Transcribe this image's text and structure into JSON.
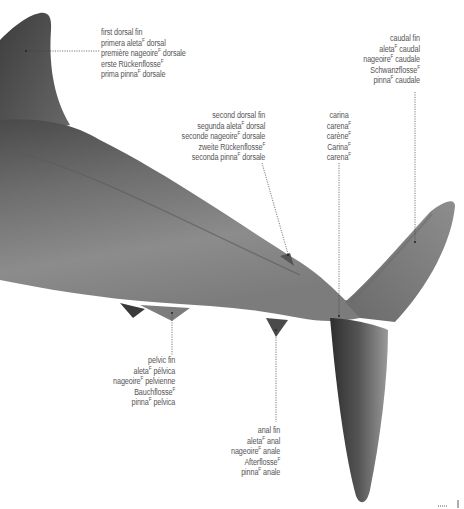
{
  "figure": {
    "colors": {
      "body_dark": "#3f3f3f",
      "body_mid": "#7a7a7a",
      "body_light": "#9a9a9a",
      "leader_line": "#444444",
      "text": "#555555"
    }
  },
  "labels": {
    "first_dorsal_fin": {
      "en": "first dorsal fin",
      "es": "primera aleta",
      "es_tail": " dorsal",
      "fr": "première nageoire",
      "fr_tail": " dorsale",
      "de": "erste Rückenflosse",
      "de_tail": "",
      "it": "prima pinna",
      "it_tail": " dorsale",
      "gender": "F"
    },
    "caudal_fin": {
      "en": "caudal fin",
      "es": "aleta",
      "es_tail": " caudal",
      "fr": "nageoire",
      "fr_tail": " caudale",
      "de": "Schwanzflosse",
      "de_tail": "",
      "it": "pinna",
      "it_tail": " caudale",
      "gender": "F"
    },
    "second_dorsal_fin": {
      "en": "second dorsal fin",
      "es": "segunda aleta",
      "es_tail": " dorsal",
      "fr": "seconde nageoire",
      "fr_tail": " dorsale",
      "de": "zweite Rückenflosse",
      "de_tail": "",
      "it": "seconda pinna",
      "it_tail": " dorsale",
      "gender": "F"
    },
    "carina": {
      "en": "carina",
      "es": "carena",
      "es_tail": "",
      "fr": "carène",
      "fr_tail": "",
      "de": "Carina",
      "de_tail": "",
      "it": "carena",
      "it_tail": "",
      "gender": "F"
    },
    "pelvic_fin": {
      "en": "pelvic fin",
      "es": "aleta",
      "es_tail": " pélvica",
      "fr": "nageoire",
      "fr_tail": " pelvienne",
      "de": "Bauchflosse",
      "de_tail": "",
      "it": "pinna",
      "it_tail": " pelvica",
      "gender": "F"
    },
    "anal_fin": {
      "en": "anal fin",
      "es": "aleta",
      "es_tail": " anal",
      "fr": "nageoire",
      "fr_tail": " anale",
      "de": "Afterflosse",
      "de_tail": "",
      "it": "pinna",
      "it_tail": " anale",
      "gender": "F"
    }
  }
}
